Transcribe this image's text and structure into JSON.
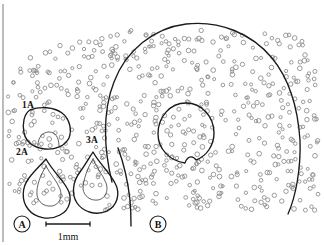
{
  "figure": {
    "background_color": "#ffffff",
    "outline_color": "#1a1a1a",
    "dot_outline_color": "#8a8a8a",
    "width_px": 324,
    "height_px": 246
  },
  "panels": [
    {
      "id": "A",
      "label": "A",
      "label_x": 22,
      "label_y": 228,
      "ring_r": 8
    },
    {
      "id": "B",
      "label": "B",
      "label_x": 158,
      "label_y": 228,
      "ring_r": 8
    }
  ],
  "region_labels": [
    {
      "id": "1A",
      "text": "1A",
      "x": 22,
      "y": 108
    },
    {
      "id": "2A",
      "text": "2A",
      "x": 16,
      "y": 155
    },
    {
      "id": "3A",
      "text": "3A",
      "x": 86,
      "y": 143
    }
  ],
  "scale_bar": {
    "label": "1mm",
    "x_start": 46,
    "x_end": 90,
    "y": 224,
    "cap_height": 5,
    "text_x": 68,
    "text_y": 240
  },
  "outlines": {
    "region_B_outer": "M 112 182 C 104 150 102 112 114 82 C 126 50 154 28 186 24 C 220 20 252 34 272 58 C 290 80 298 110 300 140 C 301 168 296 196 288 214",
    "region_B_inner_circle": "M 186 103 C 202 103 214 117 214 133 C 214 145 207 156 196 160 C 194 157 191 156 188 158 C 186 160 185 162 185 163 C 170 161 158 149 158 134 C 158 117 170 103 186 103 Z",
    "region_1A": "M 30 110 C 40 106 54 107 62 113 C 70 119 72 130 69 138 C 65 146 55 150 45 149 C 34 148 26 142 24 133 C 22 124 24 114 30 110 Z",
    "region_1A_inner": "M 38 145 C 38 137 43 132 49 132 C 55 132 59 137 59 146",
    "region_2A": "M 46 159 C 52 170 62 179 67 188 C 73 198 70 210 60 215 C 49 221 35 218 28 209 C 21 200 22 187 29 178 C 35 170 41 165 46 159 Z",
    "region_2A_inner": "M 46 166 C 50 174 57 181 60 189 C 63 197 59 205 52 206 C 44 207 38 202 37 195 C 36 186 41 174 46 166 Z",
    "region_3A": "M 93 152 C 99 163 110 173 115 183 C 121 194 117 206 107 211 C 96 216 83 212 77 203 C 71 194 73 181 80 172 C 85 165 89 158 93 152 Z",
    "region_3A_inner": "M 93 159 C 96 167 103 175 106 183 C 109 191 105 199 98 200 C 90 201 84 196 83 189 C 83 180 88 167 93 159 Z",
    "region_3A_tail": "M 118 148 C 124 164 128 182 130 200 C 131 212 131 220 131 226"
  },
  "dot_field": {
    "description": "Small unfilled circles representing scattered elements",
    "radius_px": 1.9,
    "count": 640,
    "seed": 20240517,
    "margin_top": 24,
    "margin_bottom": 214,
    "margin_left": 8,
    "margin_right": 318
  },
  "frame": {
    "left_line_x": 3,
    "top_y": 4,
    "bottom_y": 242
  }
}
